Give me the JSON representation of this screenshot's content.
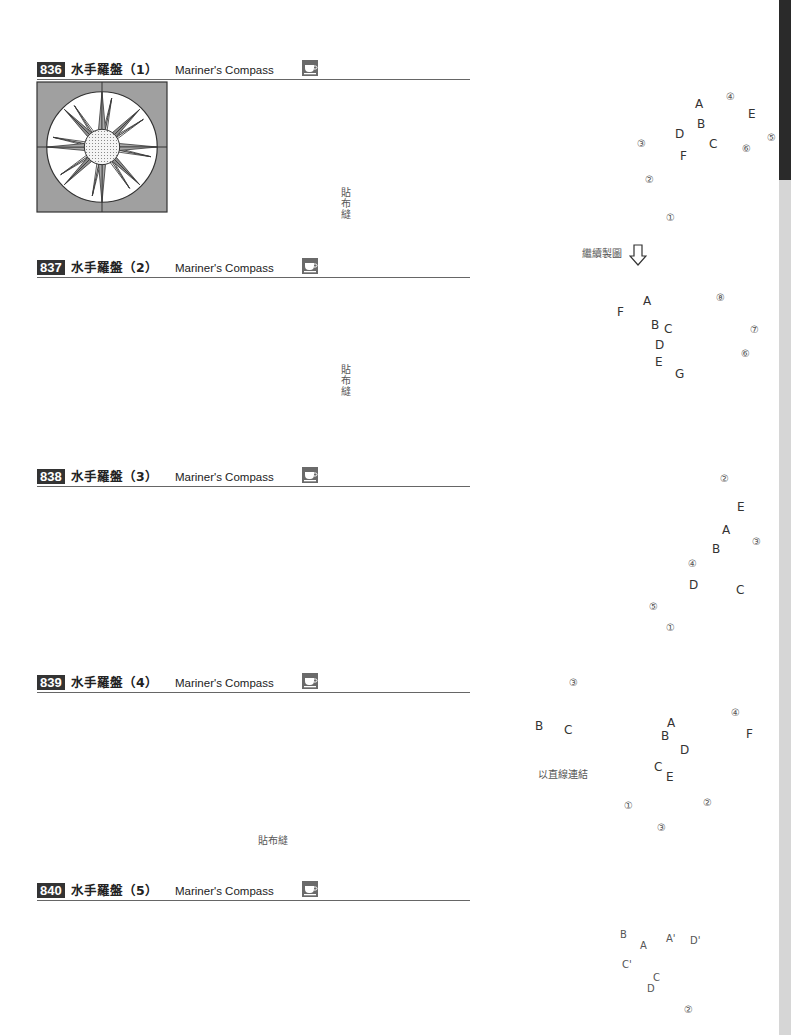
{
  "page": {
    "side_tab": {
      "dark_color": "#2a2a2a",
      "light_color": "#d6d6d6"
    },
    "colors": {
      "line": "#333333",
      "dark_fill": "#8c8c8c",
      "mid_fill": "#a8a8a8",
      "light_fill": "#e2e2e2",
      "dash": "#888888"
    }
  },
  "sections": [
    {
      "number": "836",
      "title_zh": "水手羅盤（1）",
      "title_en": "Mariner's Compass",
      "icon": "teacup-icon",
      "labels": {
        "applique": "貼布縫",
        "pieces": [
          "A",
          "B",
          "C",
          "D",
          "E",
          "F"
        ],
        "steps": [
          "①",
          "②",
          "③",
          "④",
          "⑤",
          "⑥"
        ]
      }
    },
    {
      "number": "837",
      "title_zh": "水手羅盤（2）",
      "title_en": "Mariner's Compass",
      "icon": "teacup-icon",
      "labels": {
        "applique": "貼布縫",
        "continue": "繼續製圖",
        "pieces": [
          "A",
          "B",
          "C",
          "D",
          "E",
          "F",
          "G"
        ],
        "steps": [
          "⑥",
          "⑦",
          "⑧"
        ]
      }
    },
    {
      "number": "838",
      "title_zh": "水手羅盤（3）",
      "title_en": "Mariner's Compass",
      "icon": "teacup-icon",
      "labels": {
        "pieces": [
          "A",
          "B",
          "C",
          "D",
          "E"
        ],
        "steps": [
          "①",
          "②",
          "③",
          "④",
          "⑤"
        ]
      }
    },
    {
      "number": "839",
      "title_zh": "水手羅盤（4）",
      "title_en": "Mariner's Compass",
      "icon": "teacup-icon",
      "labels": {
        "applique": "貼布縫",
        "connect": "以直線連結",
        "detail_pieces": [
          "B",
          "C"
        ],
        "detail_step": "③",
        "pieces": [
          "A",
          "B",
          "C",
          "D",
          "E",
          "F"
        ],
        "steps": [
          "①",
          "②",
          "③",
          "④"
        ]
      }
    },
    {
      "number": "840",
      "title_zh": "水手羅盤（5）",
      "title_en": "Mariner's Compass",
      "icon": "teacup-icon",
      "labels": {
        "pieces": [
          "B",
          "A",
          "A'",
          "D'",
          "C'",
          "C",
          "D"
        ],
        "steps": [
          "②"
        ]
      }
    }
  ]
}
